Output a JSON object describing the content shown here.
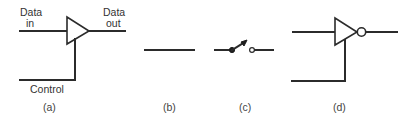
{
  "figure": {
    "panels": [
      {
        "id": "a",
        "caption": "(a)",
        "symbol": "tri-state-buffer",
        "labels": {
          "data_in_line1": "Data",
          "data_in_line2": "in",
          "data_out_line1": "Data",
          "data_out_line2": "out",
          "control": "Control"
        }
      },
      {
        "id": "b",
        "caption": "(b)",
        "symbol": "closed-connection-wire"
      },
      {
        "id": "c",
        "caption": "(c)",
        "symbol": "open-switch"
      },
      {
        "id": "d",
        "caption": "(d)",
        "symbol": "tri-state-inverter"
      }
    ],
    "colors": {
      "stroke": "#2b2b2b",
      "text": "#333333",
      "background": "#ffffff"
    }
  }
}
